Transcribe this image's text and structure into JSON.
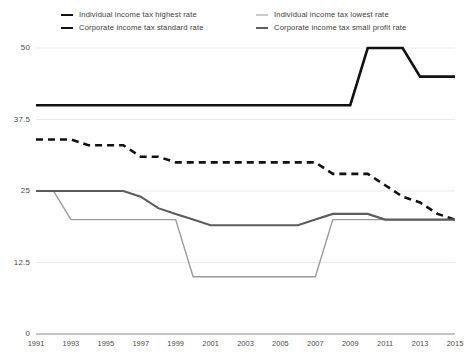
{
  "chart_data": {
    "type": "line",
    "title": "",
    "subtitle": "",
    "xlabel": "",
    "ylabel": "",
    "xlim": [
      1991,
      2015
    ],
    "ylim": [
      0,
      50
    ],
    "grid": true,
    "legend_position": "top",
    "ytick_labels": [
      "0",
      "12.5",
      "25",
      "37.5",
      "50"
    ],
    "ytick_values": [
      0,
      12.5,
      25,
      37.5,
      50
    ],
    "xtick_labels": [
      "1991",
      "1993",
      "1995",
      "1997",
      "1999",
      "2001",
      "2003",
      "2005",
      "2007",
      "2009",
      "2011",
      "2013",
      "2015"
    ],
    "xtick_values": [
      1991,
      1993,
      1995,
      1997,
      1999,
      2001,
      2003,
      2005,
      2007,
      2009,
      2011,
      2013,
      2015
    ],
    "x": [
      1991,
      1992,
      1993,
      1994,
      1995,
      1996,
      1997,
      1998,
      1999,
      2000,
      2001,
      2002,
      2003,
      2004,
      2005,
      2006,
      2007,
      2008,
      2009,
      2010,
      2011,
      2012,
      2013,
      2014,
      2015
    ],
    "series": [
      {
        "name": "Individual income tax highest rate",
        "style": "solid",
        "color": "#111111",
        "width": 2.6,
        "values": [
          40,
          40,
          40,
          40,
          40,
          40,
          40,
          40,
          40,
          40,
          40,
          40,
          40,
          40,
          40,
          40,
          40,
          40,
          40,
          50,
          50,
          50,
          45,
          45,
          45
        ]
      },
      {
        "name": "Corporate income tax standard rate",
        "style": "dashed",
        "color": "#111111",
        "width": 2.6,
        "values": [
          34,
          34,
          34,
          33,
          33,
          33,
          31,
          31,
          30,
          30,
          30,
          30,
          30,
          30,
          30,
          30,
          30,
          28,
          28,
          28,
          26,
          24,
          23,
          21,
          20
        ]
      },
      {
        "name": "Individual income tax lowest rate",
        "style": "solid",
        "color": "#9a9a9a",
        "width": 1.4,
        "values": [
          25,
          25,
          20,
          20,
          20,
          20,
          20,
          20,
          20,
          10,
          10,
          10,
          10,
          10,
          10,
          10,
          10,
          20,
          20,
          20,
          20,
          20,
          20,
          20,
          20
        ]
      },
      {
        "name": "Corporate income tax small profit rate",
        "style": "solid",
        "color": "#5c5c5c",
        "width": 2.1,
        "values": [
          25,
          25,
          25,
          25,
          25,
          25,
          24,
          22,
          21,
          20,
          19,
          19,
          19,
          19,
          19,
          19,
          20,
          21,
          21,
          21,
          20,
          20,
          20,
          20,
          20
        ]
      }
    ]
  },
  "legend": {
    "items": [
      {
        "label": "Individual income tax highest rate",
        "swatch": "solid-black"
      },
      {
        "label": "Individual income tax lowest rate",
        "swatch": "solid-light"
      },
      {
        "label": "Corporate income tax standard rate",
        "swatch": "dashed-black"
      },
      {
        "label": "Corporate income tax small profit rate",
        "swatch": "solid-dark"
      }
    ]
  }
}
